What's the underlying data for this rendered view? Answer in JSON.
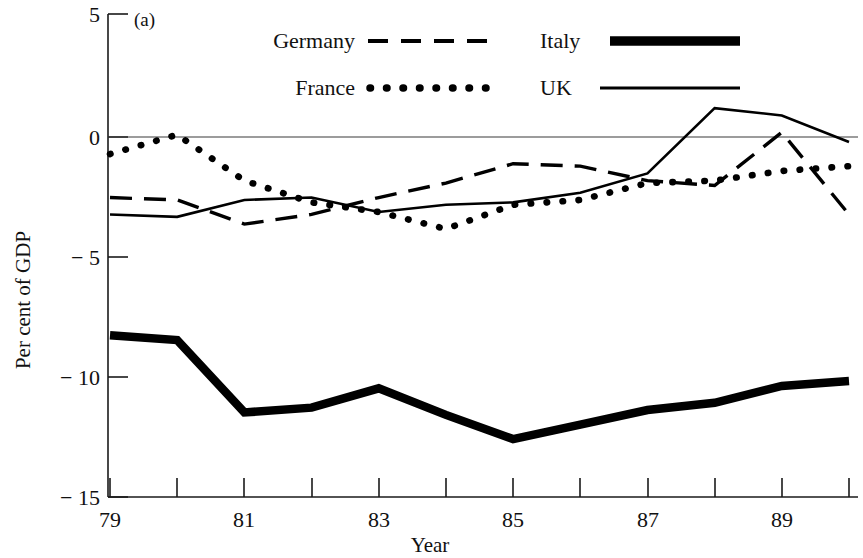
{
  "figure": {
    "panel_label": "(a)",
    "background": "#ffffff",
    "ink_color": "#000000"
  },
  "axes": {
    "ylabel": "Per cent of GDP",
    "xlabel": "Year",
    "y_ticks": [
      "5",
      "0",
      "− 5",
      "− 10",
      "− 15"
    ],
    "x_ticks": [
      "79",
      "",
      "81",
      "",
      "83",
      "",
      "85",
      "",
      "87",
      "",
      "89",
      ""
    ]
  },
  "legend": {
    "entries": [
      {
        "label": "Germany",
        "style": "dashed"
      },
      {
        "label": "France",
        "style": "dotted"
      },
      {
        "label": "Italy",
        "style": "thick-solid"
      },
      {
        "label": "UK",
        "style": "thin-solid"
      }
    ]
  },
  "chart_data": {
    "type": "line",
    "title": "",
    "subtitle": "",
    "panel_label": "(a)",
    "xlabel": "Year",
    "ylabel": "Per cent of GDP",
    "xlim": [
      79,
      90
    ],
    "ylim": [
      -15,
      5
    ],
    "y_ticks": [
      5,
      0,
      -5,
      -10,
      -15
    ],
    "x_ticks": [
      79,
      80,
      81,
      82,
      83,
      84,
      85,
      86,
      87,
      88,
      89,
      90
    ],
    "x_tick_labels": [
      "79",
      "",
      "81",
      "",
      "83",
      "",
      "85",
      "",
      "87",
      "",
      "89",
      ""
    ],
    "grid": false,
    "legend_position": "top",
    "x": [
      79,
      80,
      81,
      82,
      83,
      84,
      85,
      86,
      87,
      88,
      89,
      90
    ],
    "series": [
      {
        "name": "Germany",
        "style": "dashed",
        "values": [
          -2.6,
          -2.7,
          -3.7,
          -3.3,
          -2.6,
          -2.0,
          -1.2,
          -1.3,
          -1.9,
          -2.1,
          0.1,
          -3.3
        ]
      },
      {
        "name": "France",
        "style": "dotted",
        "values": [
          -0.8,
          0.0,
          -1.9,
          -2.8,
          -3.2,
          -3.9,
          -2.9,
          -2.7,
          -2.0,
          -1.9,
          -1.5,
          -1.3
        ]
      },
      {
        "name": "Italy",
        "style": "thick-solid",
        "values": [
          -8.3,
          -8.5,
          -11.5,
          -11.3,
          -10.5,
          -11.6,
          -12.6,
          -12.0,
          -11.4,
          -11.1,
          -10.4,
          -10.2
        ]
      },
      {
        "name": "UK",
        "style": "thin-solid",
        "values": [
          -3.3,
          -3.4,
          -2.7,
          -2.6,
          -3.2,
          -2.9,
          -2.8,
          -2.4,
          -1.6,
          1.1,
          0.8,
          -0.3
        ]
      }
    ]
  }
}
